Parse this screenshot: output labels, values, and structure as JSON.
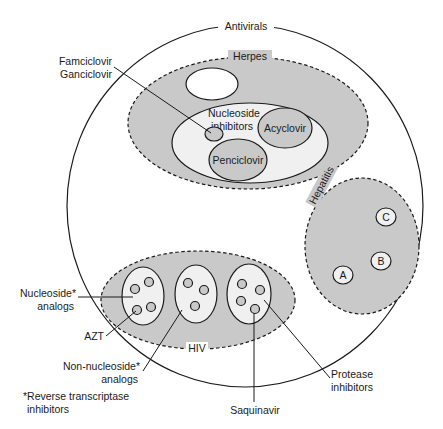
{
  "diagram": {
    "title": "Antivirals",
    "colors": {
      "group_fill": "#c9c9c9",
      "subgroup_fill": "#f0f0f0",
      "outline": "#1a1a1a",
      "background": "#ffffff"
    },
    "groups": {
      "herpes": {
        "label": "Herpes",
        "subgroup_label_line1": "Nucleoside",
        "subgroup_label_line2": "inhibitors",
        "drugs": [
          "Acyclovir",
          "Penciclovir"
        ],
        "callout_line1": "Famciclovir",
        "callout_line2": "Ganciclovir"
      },
      "hepatitis": {
        "label": "Hepatitis",
        "subtypes": [
          "A",
          "B",
          "C"
        ]
      },
      "hiv": {
        "label": "HIV",
        "callouts": {
          "nucleoside_line1": "Nucleoside*",
          "nucleoside_line2": "analogs",
          "azt": "AZT",
          "non_nucleoside_line1": "Non-nucleoside*",
          "non_nucleoside_line2": "analogs",
          "saquinavir": "Saquinavir",
          "protease_line1": "Protease",
          "protease_line2": "inhibitors"
        }
      }
    },
    "footnote_line1": "*Reverse transcriptase",
    "footnote_line2": "inhibitors"
  }
}
